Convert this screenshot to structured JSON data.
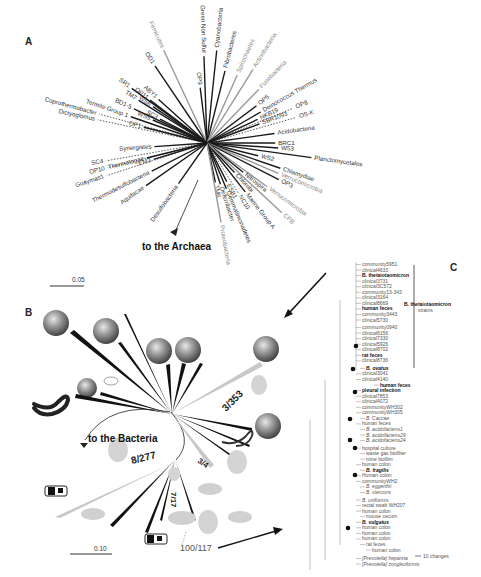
{
  "figure": {
    "panels": {
      "A": {
        "letter": "A",
        "title_arrow": "to the Archaea",
        "scale_bar": "0.05",
        "taxa": [
          {
            "name": "OD1",
            "angle": -124,
            "len": 150,
            "style": "solid"
          },
          {
            "name": "Firmicutes",
            "angle": -115,
            "len": 165,
            "style": "gray"
          },
          {
            "name": "OP9",
            "angle": -97,
            "len": 90,
            "style": "solid"
          },
          {
            "name": "Green Non Sulfur",
            "angle": -92,
            "len": 140,
            "style": "solid"
          },
          {
            "name": "Cyanobacteria",
            "angle": -84,
            "len": 150,
            "style": "solid"
          },
          {
            "name": "Fibrobacteres",
            "angle": -76,
            "len": 120,
            "style": "solid"
          },
          {
            "name": "Spirochaetes",
            "angle": -66,
            "len": 120,
            "style": "gray"
          },
          {
            "name": "Actinobacteria",
            "angle": -58,
            "len": 140,
            "style": "gray"
          },
          {
            "name": "Fusobacteria",
            "angle": -46,
            "len": 120,
            "style": "gray"
          },
          {
            "name": "OP5",
            "angle": -37,
            "len": 100,
            "style": "solid"
          },
          {
            "name": "Deinococcus Thermus",
            "angle": -30,
            "len": 100,
            "style": "solid"
          },
          {
            "name": "NKB19",
            "angle": -25,
            "len": 90,
            "style": "solid"
          },
          {
            "name": "SBR1093",
            "angle": -20,
            "len": 90,
            "style": "solid"
          },
          {
            "name": "OP8",
            "angle": -22,
            "len": 150,
            "style": "dotted"
          },
          {
            "name": "OS-K",
            "angle": -16,
            "len": 150,
            "style": "dotted"
          },
          {
            "name": "Acidobacteria",
            "angle": -8,
            "len": 110,
            "style": "solid"
          },
          {
            "name": "BRC1",
            "angle": 0,
            "len": 110,
            "style": "solid"
          },
          {
            "name": "W53",
            "angle": 4,
            "len": 115,
            "style": "solid"
          },
          {
            "name": "Planctomycetales",
            "angle": 8,
            "len": 170,
            "style": "solid"
          },
          {
            "name": "WS2",
            "angle": 14,
            "len": 85,
            "style": "solid"
          },
          {
            "name": "Chlamydiae",
            "angle": 19,
            "len": 125,
            "style": "solid"
          },
          {
            "name": "Verrucomicrobia",
            "angle": 23,
            "len": 125,
            "style": "gray"
          },
          {
            "name": "OP3",
            "angle": 27,
            "len": 130,
            "style": "solid"
          },
          {
            "name": "Verrucomicrobia",
            "angle": 36,
            "len": 120,
            "style": "gray"
          },
          {
            "name": "Nitrospira",
            "angle": 39,
            "len": 75,
            "style": "solid"
          },
          {
            "name": "Chlorobi",
            "angle": 47,
            "len": 65,
            "style": "solid"
          },
          {
            "name": "Marine Group A",
            "angle": 52,
            "len": 100,
            "style": "solid"
          },
          {
            "name": "CFB",
            "angle": 43,
            "len": 165,
            "style": "gray"
          },
          {
            "name": "NC10",
            "angle": 58,
            "len": 95,
            "style": "dotted"
          },
          {
            "name": "ESB1",
            "angle": 63,
            "len": 70,
            "style": "solid"
          },
          {
            "name": "Gemmatimonadetes",
            "angle": 67,
            "len": 80,
            "style": "solid"
          },
          {
            "name": "Deferribacter",
            "angle": 72,
            "len": 70,
            "style": "solid"
          },
          {
            "name": "TM6",
            "angle": 78,
            "len": 65,
            "style": "solid"
          },
          {
            "name": "Proteobacteria",
            "angle": 80,
            "len": 130,
            "style": "gray"
          },
          {
            "name": "Desulfobacteria",
            "angle": 125,
            "len": 80,
            "style": "solid"
          },
          {
            "name": "Aquifacae",
            "angle": 145,
            "len": 120,
            "style": "solid"
          },
          {
            "name": "Thermodesulfobacteria",
            "angle": 153,
            "len": 100,
            "style": "solid"
          },
          {
            "name": "Guaymas1",
            "angle": 162,
            "len": 170,
            "style": "dotted"
          },
          {
            "name": "EM3",
            "angle": 163,
            "len": 90,
            "style": "solid"
          },
          {
            "name": "Thermotogae",
            "angle": 166,
            "len": 100,
            "style": "solid"
          },
          {
            "name": "OP10",
            "angle": 166,
            "len": 165,
            "style": "dotted"
          },
          {
            "name": "SC4",
            "angle": 170,
            "len": 165,
            "style": "dotted"
          },
          {
            "name": "Synergistes",
            "angle": 176,
            "len": 85,
            "style": "solid"
          },
          {
            "name": "Dictyoglomus",
            "angle": -168,
            "len": 180,
            "style": "dotted"
          },
          {
            "name": "Coprothermobacter",
            "angle": -165,
            "len": 180,
            "style": "dotted"
          },
          {
            "name": "OP1",
            "angle": -166,
            "len": 105,
            "style": "solid"
          },
          {
            "name": "Termite Group 1",
            "angle": -161,
            "len": 130,
            "style": "solid"
          },
          {
            "name": "WS5",
            "angle": -157,
            "len": 95,
            "style": "solid"
          },
          {
            "name": "SC3",
            "angle": -153,
            "len": 85,
            "style": "solid"
          },
          {
            "name": "BD1-5",
            "angle": -155,
            "len": 130,
            "style": "solid"
          },
          {
            "name": "TM7",
            "angle": -148,
            "len": 130,
            "style": "solid"
          },
          {
            "name": "WS6",
            "angle": -146,
            "len": 105,
            "style": "solid"
          },
          {
            "name": "OP11",
            "angle": -143,
            "len": 115,
            "style": "solid"
          },
          {
            "name": "SR1",
            "angle": -144,
            "len": 150,
            "style": "solid"
          },
          {
            "name": "ABY1",
            "angle": -138,
            "len": 105,
            "style": "solid"
          }
        ]
      },
      "B": {
        "letter": "B",
        "title_arrow": "to the Bacteria",
        "scale_bar": "0.10",
        "ratios": [
          "8/277",
          "3/353",
          "3/4",
          "7/17",
          "100/117"
        ]
      },
      "C": {
        "letter": "C",
        "scale_bar": "10 changes",
        "bracket_label_bold": "B. thetaiotaomicron",
        "bracket_label": "strains",
        "leaves": [
          {
            "t": "community5951",
            "s": "n"
          },
          {
            "t": "clinical4633",
            "s": "n"
          },
          {
            "t": "B. thetaiotaomicron",
            "s": "b"
          },
          {
            "t": "clinical3731",
            "s": "n"
          },
          {
            "t": "clinical3C572",
            "s": "n"
          },
          {
            "t": "community13-343",
            "s": "n"
          },
          {
            "t": "clinical3164",
            "s": "n"
          },
          {
            "t": "clinical8669",
            "s": "n"
          },
          {
            "t": "human feces",
            "s": "b"
          },
          {
            "t": "community3443",
            "s": "n"
          },
          {
            "t": "clinical5730",
            "s": "n"
          },
          {
            "t": "community0940",
            "s": "n"
          },
          {
            "t": "clinical6156",
            "s": "n"
          },
          {
            "t": "clinical7330",
            "s": "n"
          },
          {
            "t": "clinical5926",
            "s": "n"
          },
          {
            "t": "clinical8702",
            "s": "n"
          },
          {
            "t": "rat feces",
            "s": "b"
          },
          {
            "t": "clinical8736",
            "s": "n"
          },
          {
            "t": "B. ovatus",
            "s": "bi"
          },
          {
            "t": "clinical3041",
            "s": "n"
          },
          {
            "t": "clinical4140",
            "s": "n"
          },
          {
            "t": "human feces",
            "s": "b"
          },
          {
            "t": "pleural infection",
            "s": "b"
          },
          {
            "t": "clinical7853",
            "s": "n"
          },
          {
            "t": "clinical4072",
            "s": "n"
          },
          {
            "t": "communityWH302",
            "s": "n"
          },
          {
            "t": "communityWH305",
            "s": "n"
          },
          {
            "t": "B. Caccae",
            "s": "i"
          },
          {
            "t": "human feces",
            "s": "n"
          },
          {
            "t": "B. acidofaciens1",
            "s": "i"
          },
          {
            "t": "B. acidofaciens29",
            "s": "i"
          },
          {
            "t": "B. acidofaciens24",
            "s": "i"
          },
          {
            "t": "hospital culture",
            "s": "n"
          },
          {
            "t": "waste gas biofilter",
            "s": "n"
          },
          {
            "t": "mine biofilm",
            "s": "n"
          },
          {
            "t": "human colon",
            "s": "n"
          },
          {
            "t": "B. fragilis",
            "s": "bi"
          },
          {
            "t": "Human colon",
            "s": "n"
          },
          {
            "t": "communityWH2",
            "s": "n"
          },
          {
            "t": "B. eggerthii",
            "s": "i"
          },
          {
            "t": "B. stercoris",
            "s": "i"
          },
          {
            "t": "B. uniformis",
            "s": "i"
          },
          {
            "t": "rectal swab WH207",
            "s": "n"
          },
          {
            "t": "human colon",
            "s": "n"
          },
          {
            "t": "mouse cecum",
            "s": "n"
          },
          {
            "t": "B. vulgatus",
            "s": "bi"
          },
          {
            "t": "human colon",
            "s": "n"
          },
          {
            "t": "human colon",
            "s": "n"
          },
          {
            "t": "human colon",
            "s": "n"
          },
          {
            "t": "rat feces",
            "s": "n"
          },
          {
            "t": "human colon",
            "s": "n"
          },
          {
            "t": "[Prevotella] heparina",
            "s": "i"
          },
          {
            "t": "[Prevotella] zoogleoformis",
            "s": "i"
          }
        ]
      }
    }
  }
}
